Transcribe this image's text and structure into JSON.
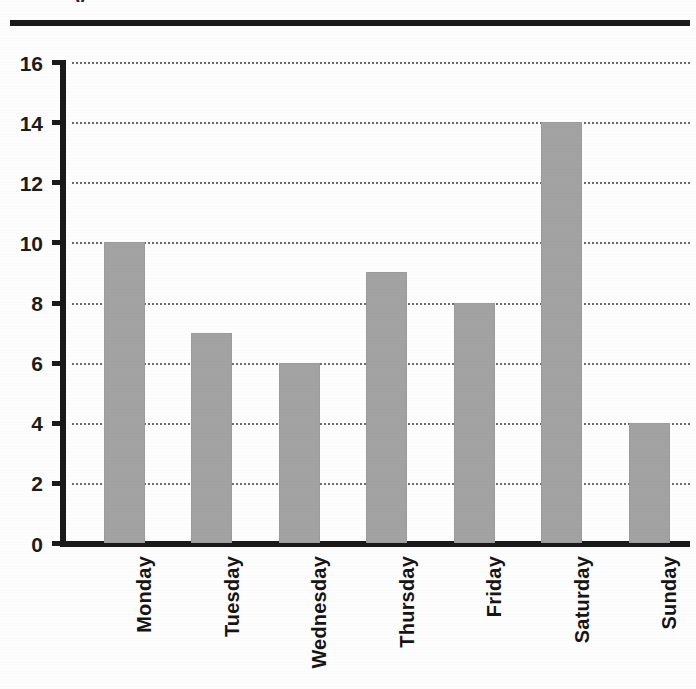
{
  "chart_data": {
    "type": "bar",
    "title": "",
    "title_remnant": "y",
    "xlabel": "",
    "ylabel": "",
    "categories": [
      "Monday",
      "Tuesday",
      "Wednesday",
      "Thursday",
      "Friday",
      "Saturday",
      "Sunday"
    ],
    "values": [
      10,
      7,
      6,
      9,
      8,
      14,
      4
    ],
    "ylim": [
      0,
      16
    ],
    "yticks": [
      0,
      2,
      4,
      6,
      8,
      10,
      12,
      14,
      16
    ],
    "ytick_labels": [
      "0",
      "2",
      "4",
      "6",
      "8",
      "10",
      "12",
      "14",
      "16"
    ],
    "grid": true,
    "grid_style": "dotted",
    "legend": "none",
    "bar_color": "#a3a3a3",
    "axis_color": "#1a1a1a",
    "grid_color": "#6b6b6b",
    "label_rotation": 90
  }
}
